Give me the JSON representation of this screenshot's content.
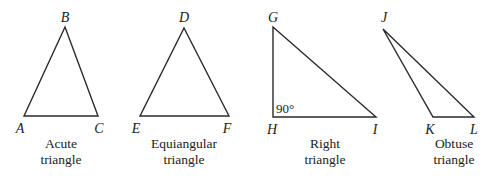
{
  "figure": {
    "triangles": [
      {
        "id": "acute",
        "caption_line1": "Acute",
        "caption_line2": "triangle",
        "vertices": [
          {
            "label": "B",
            "x": 65,
            "y": 27,
            "lx": 65,
            "ly": 22
          },
          {
            "label": "A",
            "x": 24,
            "y": 116,
            "lx": 20,
            "ly": 133
          },
          {
            "label": "C",
            "x": 98,
            "y": 116,
            "lx": 99,
            "ly": 133
          }
        ],
        "caption_x": 61
      },
      {
        "id": "equiangular",
        "caption_line1": "Equiangular",
        "caption_line2": "triangle",
        "vertices": [
          {
            "label": "D",
            "x": 184,
            "y": 28,
            "lx": 184,
            "ly": 22
          },
          {
            "label": "E",
            "x": 140,
            "y": 116,
            "lx": 136,
            "ly": 133
          },
          {
            "label": "F",
            "x": 229,
            "y": 116,
            "lx": 227,
            "ly": 133
          }
        ],
        "caption_x": 184
      },
      {
        "id": "right",
        "caption_line1": "Right",
        "caption_line2": "triangle",
        "angle_label": "90°",
        "vertices": [
          {
            "label": "G",
            "x": 273,
            "y": 27,
            "lx": 273,
            "ly": 22
          },
          {
            "label": "H",
            "x": 273,
            "y": 117,
            "lx": 272,
            "ly": 134
          },
          {
            "label": "I",
            "x": 376,
            "y": 117,
            "lx": 375,
            "ly": 134
          }
        ],
        "caption_x": 325
      },
      {
        "id": "obtuse",
        "caption_line1": "Obtuse",
        "caption_line2": "triangle",
        "vertices": [
          {
            "label": "J",
            "x": 383,
            "y": 29,
            "lx": 384,
            "ly": 22
          },
          {
            "label": "K",
            "x": 433,
            "y": 117,
            "lx": 430,
            "ly": 134
          },
          {
            "label": "L",
            "x": 474,
            "y": 117,
            "lx": 474,
            "ly": 134
          }
        ],
        "caption_x": 454
      }
    ]
  }
}
